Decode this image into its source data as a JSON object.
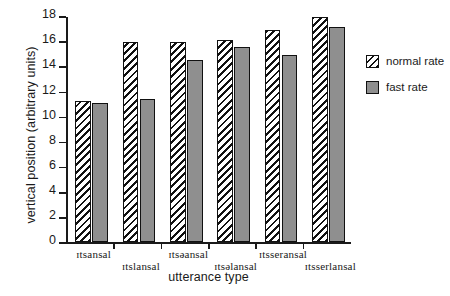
{
  "chart_data": {
    "type": "bar",
    "title": "",
    "xlabel": "utterance type",
    "ylabel": "vertical position (arbitrary units)",
    "ylim": [
      0,
      18
    ],
    "yticks": [
      0,
      2,
      4,
      6,
      8,
      10,
      12,
      14,
      16,
      18
    ],
    "ytick_labels": [
      "0",
      "2",
      "4",
      "6",
      "8",
      "10",
      "12",
      "14",
      "16",
      "18"
    ],
    "grid": false,
    "legend_position": "right",
    "categories": [
      "ɪtsansal",
      "ɪtslansal",
      "ɪtsəansal",
      "ɪtsəlansal",
      "ɪtsseransal",
      "ɪtsserlansal"
    ],
    "series": [
      {
        "name": "normal rate",
        "fill": "hatched",
        "values": [
          11.2,
          15.9,
          15.9,
          16.1,
          16.9,
          17.9
        ]
      },
      {
        "name": "fast rate",
        "fill": "solid-gray",
        "color": "#8f8f8f",
        "values": [
          11.1,
          11.4,
          14.5,
          15.5,
          14.9,
          17.1
        ]
      }
    ]
  },
  "legend": {
    "items": [
      {
        "label": "normal rate"
      },
      {
        "label": "fast rate"
      }
    ]
  },
  "axes": {
    "y_title": "vertical position (arbitrary units)",
    "x_title": "utterance type"
  }
}
